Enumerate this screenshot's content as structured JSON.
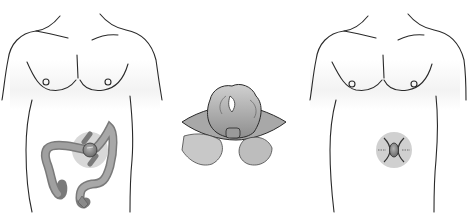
{
  "figure": {
    "description": "Three-panel medical illustration of a colostomy / stoma procedure",
    "panels": [
      {
        "id": "left",
        "label": "Torso with colon and stoma site"
      },
      {
        "id": "middle",
        "label": "Bowel loop brought through abdominal incision"
      },
      {
        "id": "right",
        "label": "Torso with stoma and surrounding sutures"
      }
    ],
    "colors": {
      "outline": "#2a2a2a",
      "skin_shade": "#f2f2f2",
      "colon_fill": "#9a9a9a",
      "colon_dark": "#6e6e6e",
      "highlight_circle": "#d4d4d4",
      "stoma_fill": "#8a8a8a",
      "incision_fill": "#a8a8a8"
    }
  }
}
